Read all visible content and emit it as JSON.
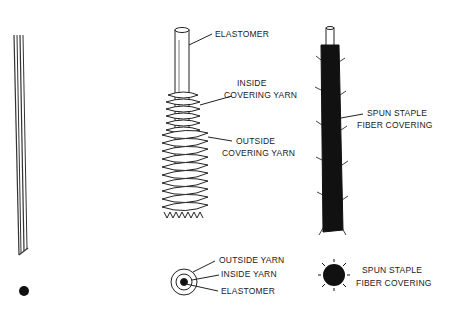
{
  "diagram": {
    "type": "technical-illustration",
    "figures": [
      {
        "id": "bare-elastomer",
        "labels": []
      },
      {
        "id": "covered-yarn",
        "labels": [
          "ELASTOMER",
          "INSIDE",
          "COVERING YARN",
          "OUTSIDE",
          "COVERING YARN"
        ]
      },
      {
        "id": "core-spun",
        "labels": [
          "SPUN STAPLE",
          "FIBER COVERING"
        ]
      }
    ]
  },
  "labels": {
    "elastomer": "ELASTOMER",
    "inside_1": "INSIDE",
    "inside_2": "COVERING YARN",
    "outside_1": "OUTSIDE",
    "outside_2": "COVERING YARN",
    "spun_1": "SPUN STAPLE",
    "spun_2": "FIBER COVERING",
    "cs_outside": "OUTSIDE YARN",
    "cs_inside": "INSIDE YARN",
    "cs_elastomer": "ELASTOMER",
    "spun_cs_1": "SPUN STAPLE",
    "spun_cs_2": "FIBER COVERING"
  }
}
